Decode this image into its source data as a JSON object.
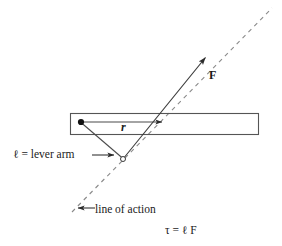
{
  "figure": {
    "background_color": "#ffffff",
    "stroke_color": "#3a3a3a",
    "text_color": "#1a1a1a"
  },
  "labels": {
    "force": "F",
    "radius": "r",
    "lever_arm": "ℓ = lever arm",
    "line_of_action": "line of action",
    "torque_equation": "τ = ℓ F"
  },
  "geometry": {
    "bar": {
      "x": 70,
      "y": 113,
      "width": 189,
      "height": 22
    },
    "pivot_point": {
      "x": 81,
      "y": 122
    },
    "application_point": {
      "x": 163,
      "y": 122
    },
    "foot_of_perpendicular": {
      "x": 123,
      "y": 159
    },
    "force_arrow": {
      "x1": 123,
      "y1": 159,
      "x2": 205,
      "y2": 58
    },
    "line_of_action": {
      "x1": 72,
      "y1": 212,
      "x2": 272,
      "y2": 8
    },
    "r_arrow": {
      "x1": 81,
      "y1": 122,
      "x2": 163,
      "y2": 122
    },
    "lever_arm_segment": {
      "x1": 81,
      "y1": 122,
      "x2": 123,
      "y2": 159
    },
    "lever_label_arrow": {
      "x1": 92,
      "y1": 155,
      "x2": 115,
      "y2": 155
    },
    "loa_label_arrow": {
      "x1": 94,
      "y1": 208,
      "x2": 77,
      "y2": 208
    }
  }
}
